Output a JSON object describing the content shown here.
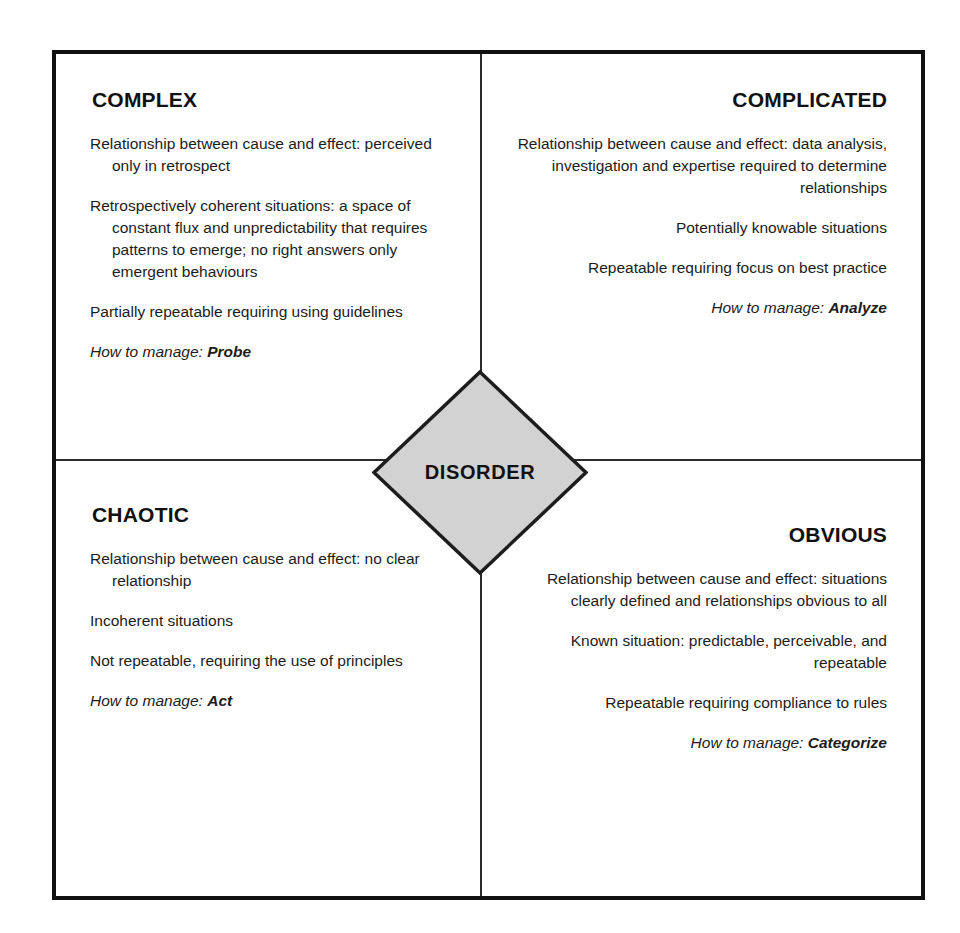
{
  "diagram": {
    "center": {
      "label": "DISORDER",
      "shape": "diamond",
      "fill_color": "#d2d2d2",
      "border_color": "#1d1d1d"
    },
    "frame": {
      "border_color": "#111111",
      "background_color": "#ffffff",
      "divider_color": "#2b2b2b"
    },
    "quadrants": [
      {
        "id": "complex",
        "title": "COMPLEX",
        "position": "top-left",
        "align": "left",
        "points": [
          "Relationship between cause and effect: perceived only in retrospect",
          "Retrospectively coherent situations: a space of constant flux and unpredictability that requires patterns to emerge; no right answers only emergent behaviours",
          "Partially repeatable requiring using guidelines"
        ],
        "manage_label": "How to manage:",
        "manage_action": "Probe"
      },
      {
        "id": "complicated",
        "title": "COMPLICATED",
        "position": "top-right",
        "align": "right",
        "points": [
          "Relationship between cause and effect: data analysis, investigation and expertise required to determine relationships",
          "Potentially knowable situations",
          "Repeatable requiring focus on best practice"
        ],
        "manage_label": "How to manage:",
        "manage_action": "Analyze"
      },
      {
        "id": "chaotic",
        "title": "CHAOTIC",
        "position": "bottom-left",
        "align": "left",
        "points": [
          "Relationship between cause and effect: no clear relationship",
          "Incoherent situations",
          "Not repeatable, requiring the use of principles"
        ],
        "manage_label": "How to manage:",
        "manage_action": "Act"
      },
      {
        "id": "obvious",
        "title": "OBVIOUS",
        "position": "bottom-right",
        "align": "right",
        "points": [
          "Relationship between cause and effect: situations clearly defined and relationships obvious to all",
          "Known situation: predictable, perceivable, and repeatable",
          "Repeatable requiring compliance to rules"
        ],
        "manage_label": "How to manage:",
        "manage_action": "Categorize"
      }
    ]
  }
}
